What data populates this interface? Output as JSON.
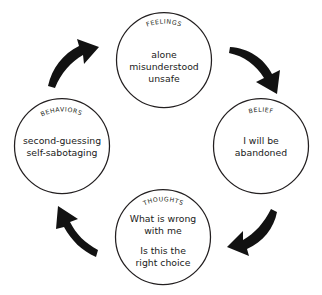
{
  "diagram": {
    "type": "cycle",
    "title_visible": false,
    "background_color": "#ffffff",
    "stroke_color": "#231f20",
    "arrow_color": "#121212",
    "direction": "clockwise",
    "nodes": [
      {
        "id": "feelings",
        "label": "FEELINGS",
        "position": "top",
        "lines": [
          "alone",
          "misunderstood",
          "unsafe"
        ],
        "line_1": "alone",
        "line_2": "misunderstood",
        "line_3": "unsafe"
      },
      {
        "id": "belief",
        "label": "BELIEF",
        "position": "right",
        "lines": [
          "I will be",
          "abandoned"
        ],
        "line_1": "I will be",
        "line_2": "abandoned"
      },
      {
        "id": "thoughts",
        "label": "THOUGHTS",
        "position": "bottom",
        "lines": [
          "What is wrong",
          "with me",
          "Is this the",
          "right choice"
        ],
        "line_1": "What is wrong",
        "line_2": "with me",
        "line_3": "Is this the",
        "line_4": "right choice"
      },
      {
        "id": "behaviors",
        "label": "BEHAVIORS",
        "position": "left",
        "lines": [
          "second-guessing",
          "self-sabotaging"
        ],
        "line_1": "second-guessing",
        "line_2": "self-sabotaging"
      }
    ],
    "arrows": [
      {
        "id": "feelings-to-belief",
        "position": "top-right",
        "from": "feelings",
        "to": "belief",
        "direction": "down-right"
      },
      {
        "id": "belief-to-thoughts",
        "position": "bottom-right",
        "from": "belief",
        "to": "thoughts",
        "direction": "down-left"
      },
      {
        "id": "thoughts-to-behaviors",
        "position": "bottom-left",
        "from": "thoughts",
        "to": "behaviors",
        "direction": "up-left"
      },
      {
        "id": "behaviors-to-feelings",
        "position": "top-left",
        "from": "behaviors",
        "to": "feelings",
        "direction": "up-right"
      }
    ]
  }
}
